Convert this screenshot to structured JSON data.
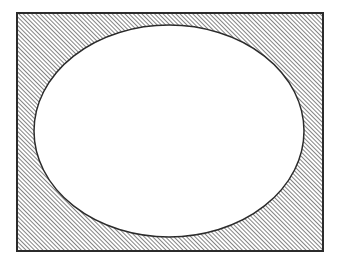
{
  "figure": {
    "kind": "geometric-diagram",
    "canvas": {
      "width": 339,
      "height": 265,
      "background_color": "#ffffff"
    },
    "rectangle": {
      "name": "hatched-rectangle",
      "x": 17,
      "y": 13,
      "width": 306,
      "height": 238,
      "stroke_color": "#2b2b2b",
      "stroke_width": 1.6,
      "fill": "hatch-pattern"
    },
    "ellipse": {
      "name": "inscribed-ellipse",
      "cx": 169,
      "cy": 131,
      "rx": 135,
      "ry": 106,
      "stroke_color": "#2b2b2b",
      "stroke_width": 1.5,
      "fill_color": "#ffffff"
    },
    "hatch": {
      "name": "diagonal-hatch",
      "angle_degrees": 45,
      "direction": "bottom-left-to-top-right",
      "spacing_px": 3,
      "line_width_px": 1.25,
      "line_color": "#3a3a3a",
      "background_color": "#ffffff"
    }
  },
  "chart_data": {
    "type": "diagram",
    "title": "",
    "shapes": [
      {
        "id": "rect-1",
        "shape": "rectangle",
        "fill": "diagonal-hatch",
        "x": 17,
        "y": 13,
        "width": 306,
        "height": 238
      },
      {
        "id": "ellipse-1",
        "shape": "ellipse",
        "fill": "white",
        "cx": 169,
        "cy": 131,
        "rx": 135,
        "ry": 106
      }
    ],
    "annotations": [],
    "legend": []
  }
}
